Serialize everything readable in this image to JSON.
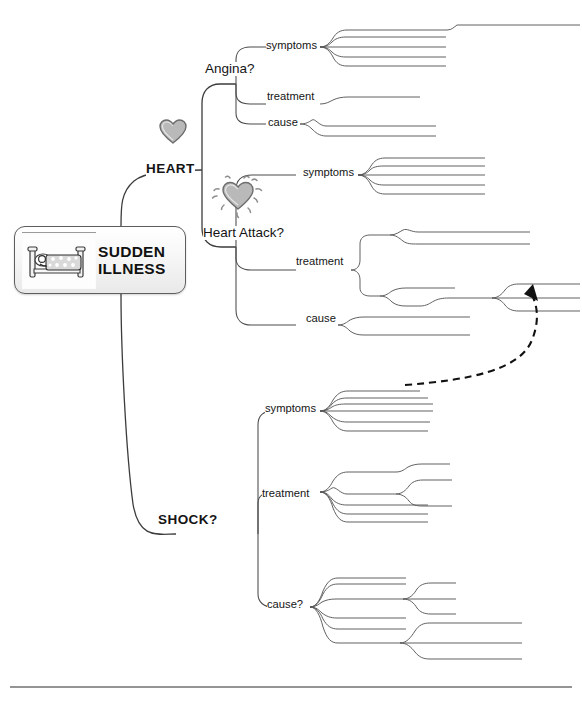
{
  "diagram": {
    "type": "mind-map",
    "title": "SUDDEN ILLNESS",
    "background_color": "#ffffff",
    "line_color": "#4a4a4a",
    "relationship_arrow_color": "#111111"
  },
  "central": {
    "label": "SUDDEN\nILLNESS",
    "icon": "bed-patient-icon"
  },
  "branches": {
    "heart": {
      "label": "HEART",
      "icon": "heart-icon",
      "children": {
        "angina": {
          "label": "Angina?",
          "children": {
            "symptoms": {
              "label": "symptoms",
              "count": 5
            },
            "treatment": {
              "label": "treatment",
              "count": 1
            },
            "cause": {
              "label": "cause",
              "count": 2
            }
          }
        },
        "heart_attack": {
          "label": "Heart Attack?",
          "icon": "heart-burst-icon",
          "children": {
            "symptoms": {
              "label": "symptoms",
              "count": 5
            },
            "treatment": {
              "label": "treatment",
              "count": 2
            },
            "cause": {
              "label": "cause",
              "count": 2
            }
          }
        }
      }
    },
    "shock": {
      "label": "SHOCK?",
      "children": {
        "symptoms": {
          "label": "symptoms",
          "count": 6
        },
        "treatment": {
          "label": "treatment",
          "count": 5
        },
        "cause": {
          "label": "cause?",
          "count": 6
        }
      }
    }
  },
  "relationship": {
    "name": "dashed-relationship-arrow",
    "from": "shock-symptoms",
    "to": "heart-attack-treatment",
    "style": "dashed-curved-arrow"
  },
  "footer": {
    "rule": true
  }
}
